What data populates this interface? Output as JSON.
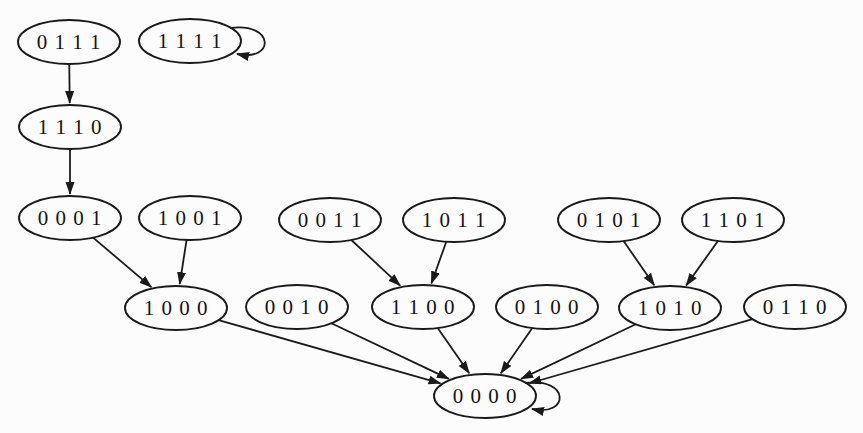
{
  "diagram": {
    "type": "state-transition-graph",
    "canvas": {
      "width": 863,
      "height": 433,
      "background": "#fcfcfc"
    },
    "style": {
      "stroke_color": "#1a1a1a",
      "node_fill": "#fcfcfc",
      "label_color": "#141414",
      "node_rx": 51,
      "node_ry": 22
    },
    "nodes": [
      {
        "id": "0111",
        "label": "0 1 1 1",
        "x": 69,
        "y": 42
      },
      {
        "id": "1111",
        "label": "1 1 1 1",
        "x": 190,
        "y": 41
      },
      {
        "id": "1110",
        "label": "1 1 1 0",
        "x": 70,
        "y": 127
      },
      {
        "id": "0001",
        "label": "0 0 0 1",
        "x": 70,
        "y": 218
      },
      {
        "id": "1001",
        "label": "1 0 0 1",
        "x": 190,
        "y": 218
      },
      {
        "id": "0011",
        "label": "0 0 1 1",
        "x": 330,
        "y": 220
      },
      {
        "id": "1011",
        "label": "1 0 1 1",
        "x": 454,
        "y": 220
      },
      {
        "id": "0101",
        "label": "0 1 0 1",
        "x": 609,
        "y": 220
      },
      {
        "id": "1101",
        "label": "1 1 0 1",
        "x": 733,
        "y": 220
      },
      {
        "id": "1000",
        "label": "1 0 0 0",
        "x": 176,
        "y": 308
      },
      {
        "id": "0010",
        "label": "0 0 1 0",
        "x": 297,
        "y": 307
      },
      {
        "id": "1100",
        "label": "1 1 0 0",
        "x": 423,
        "y": 307
      },
      {
        "id": "0100",
        "label": "0 1 0 0",
        "x": 547,
        "y": 307
      },
      {
        "id": "1010",
        "label": "1 0 1 0",
        "x": 670,
        "y": 308
      },
      {
        "id": "0110",
        "label": "0 1 1 0",
        "x": 795,
        "y": 307
      },
      {
        "id": "0000",
        "label": "0 0 0 0",
        "x": 485,
        "y": 396
      }
    ],
    "edges": [
      {
        "from": "0111",
        "to": "1110"
      },
      {
        "from": "1111",
        "to": "1111"
      },
      {
        "from": "1110",
        "to": "0001"
      },
      {
        "from": "0001",
        "to": "1000"
      },
      {
        "from": "1001",
        "to": "1000"
      },
      {
        "from": "0011",
        "to": "1100"
      },
      {
        "from": "1011",
        "to": "1100"
      },
      {
        "from": "0101",
        "to": "1010"
      },
      {
        "from": "1101",
        "to": "1010"
      },
      {
        "from": "1000",
        "to": "0000"
      },
      {
        "from": "0010",
        "to": "0000"
      },
      {
        "from": "1100",
        "to": "0000"
      },
      {
        "from": "0100",
        "to": "0000"
      },
      {
        "from": "1010",
        "to": "0000"
      },
      {
        "from": "0110",
        "to": "0000"
      },
      {
        "from": "0000",
        "to": "0000"
      }
    ]
  }
}
